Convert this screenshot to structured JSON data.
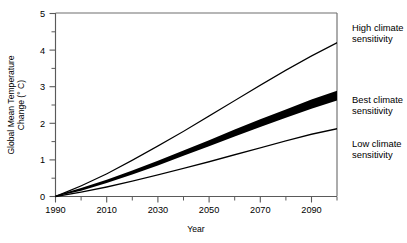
{
  "chart_data": {
    "type": "line",
    "title": "",
    "xlabel": "Year",
    "ylabel": "Global Mean Temperature Change (° C)",
    "ylabel_line1": "Global Mean Temperature",
    "ylabel_line2": "Change (° C)",
    "xlim": [
      1990,
      2100
    ],
    "ylim": [
      0,
      5
    ],
    "grid": false,
    "legend_position": "right-outside-annotations",
    "xticks": [
      1990,
      2010,
      2030,
      2050,
      2070,
      2090
    ],
    "xtick_labels": [
      "1990",
      "2010",
      "2030",
      "2050",
      "2070",
      "2090"
    ],
    "xminor_ticks": [
      2000,
      2020,
      2040,
      2060,
      2080,
      2100
    ],
    "yticks": [
      0,
      1,
      2,
      3,
      4,
      5
    ],
    "ytick_labels": [
      "0",
      "1",
      "2",
      "3",
      "4",
      "5"
    ],
    "yminor_ticks": [
      0.5,
      1.5,
      2.5,
      3.5,
      4.5
    ],
    "x": [
      1990,
      2000,
      2010,
      2020,
      2030,
      2040,
      2050,
      2060,
      2070,
      2080,
      2090,
      2100
    ],
    "series": [
      {
        "name": "High climate sensitivity",
        "label": "High climate sensitivity",
        "label_line1": "High climate",
        "label_line2": "sensitivity",
        "color": "#000000",
        "band": false,
        "values": [
          0.0,
          0.29,
          0.62,
          0.99,
          1.38,
          1.78,
          2.2,
          2.62,
          3.04,
          3.45,
          3.84,
          4.2
        ]
      },
      {
        "name": "Best climate sensitivity",
        "label": "Best climate sensitivity",
        "label_line1": "Best climate",
        "label_line2": "sensitivity",
        "color": "#000000",
        "band": true,
        "values": [
          0.0,
          0.19,
          0.41,
          0.65,
          0.91,
          1.18,
          1.45,
          1.73,
          2.0,
          2.26,
          2.52,
          2.75
        ],
        "values_upper": [
          0.03,
          0.23,
          0.46,
          0.71,
          0.98,
          1.26,
          1.54,
          1.83,
          2.11,
          2.38,
          2.65,
          2.89
        ],
        "values_lower": [
          0.0,
          0.16,
          0.37,
          0.6,
          0.85,
          1.11,
          1.37,
          1.64,
          1.9,
          2.15,
          2.4,
          2.62
        ]
      },
      {
        "name": "Low climate sensitivity",
        "label": "Low climate sensitivity",
        "label_line1": "Low climate",
        "label_line2": "sensitivity",
        "color": "#000000",
        "band": false,
        "values": [
          0.0,
          0.12,
          0.26,
          0.42,
          0.59,
          0.77,
          0.95,
          1.14,
          1.33,
          1.52,
          1.7,
          1.85
        ]
      }
    ]
  },
  "annotations": {
    "high": {
      "line1": "High climate",
      "line2": "sensitivity"
    },
    "best": {
      "line1": "Best climate",
      "line2": "sensitivity"
    },
    "low": {
      "line1": "Low climate",
      "line2": "sensitivity"
    }
  },
  "axis": {
    "x_title": "Year",
    "y_title_line1": "Global Mean Temperature",
    "y_title_line2": "Change (° C)",
    "x_labels": {
      "t0": "1990",
      "t1": "2010",
      "t2": "2030",
      "t3": "2050",
      "t4": "2070",
      "t5": "2090"
    },
    "y_labels": {
      "v0": "0",
      "v1": "1",
      "v2": "2",
      "v3": "3",
      "v4": "4",
      "v5": "5"
    }
  },
  "colors": {
    "curve": "#000000",
    "frame": "#6f6f6f",
    "background": "#ffffff"
  }
}
